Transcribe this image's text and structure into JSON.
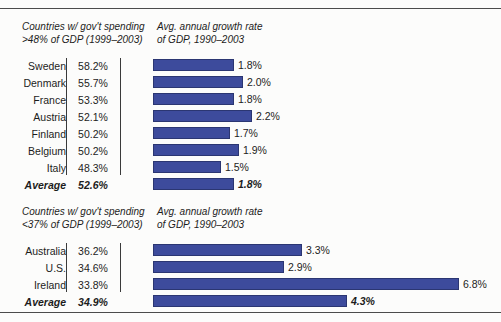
{
  "chart_data": {
    "type": "bar",
    "title": "",
    "xlabel": "",
    "ylabel": "",
    "orientation": "horizontal",
    "grid": false,
    "legend": null,
    "value_axis_range": [
      0,
      7.0
    ],
    "value_unit": "%",
    "px_per_unit": 45,
    "groups": [
      {
        "left_header": "Countries w/ gov't spending\n>48% of GDP (1999–2003)",
        "right_header": "Avg. annual growth rate\nof GDP, 1990–2003",
        "categories": [
          "Sweden",
          "Denmark",
          "France",
          "Austria",
          "Finland",
          "Belgium",
          "Italy",
          "Average"
        ],
        "spending_values": [
          "58.2%",
          "55.7%",
          "53.3%",
          "52.1%",
          "50.2%",
          "50.2%",
          "48.3%",
          "52.6%"
        ],
        "growth_labels": [
          "1.8%",
          "2.0%",
          "1.8%",
          "2.2%",
          "1.7%",
          "1.9%",
          "1.5%",
          "1.8%"
        ],
        "growth_values": [
          1.8,
          2.0,
          1.8,
          2.2,
          1.7,
          1.9,
          1.5,
          1.8
        ],
        "average_row_index": 7
      },
      {
        "left_header": "Countries w/ gov't spending\n<37% of GDP (1999–2003)",
        "right_header": "Avg. annual growth rate\nof GDP, 1990–2003",
        "categories": [
          "Australia",
          "U.S.",
          "Ireland",
          "Average"
        ],
        "spending_values": [
          "36.2%",
          "34.6%",
          "33.8%",
          "34.9%"
        ],
        "growth_labels": [
          "3.3%",
          "2.9%",
          "6.8%",
          "4.3%"
        ],
        "growth_values": [
          3.3,
          2.9,
          6.8,
          4.3
        ],
        "average_row_index": 3
      }
    ],
    "colors": {
      "bar_fill": "#3d4b9c",
      "bar_stroke": "#2b3672",
      "text": "#1c1c1c",
      "rule": "#4b4b4b",
      "background": "#fcfcfb"
    }
  }
}
